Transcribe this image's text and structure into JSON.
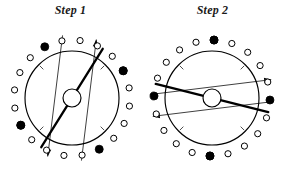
{
  "figure": {
    "caption_present": false,
    "background_color": "#ffffff",
    "stroke_color": "#000000",
    "panel_count": 2
  },
  "panels": [
    {
      "id": "step-1",
      "title": "Step 1",
      "center": {
        "x": 72,
        "y": 78
      },
      "outer_circle_radius": 47,
      "hub_circle_radius": 9,
      "marker_ring_radius": 58,
      "marker_radius": 3.1,
      "marker_count": 20,
      "filled_marker_indices": [
        2,
        7,
        12,
        17
      ],
      "ring_start_angle_deg": -64,
      "chord": {
        "label": "thick-chord",
        "angle_deg": -58,
        "stroke_width": 2.3,
        "from_marker_index": 12,
        "to_marker_index": 2
      },
      "thin_lines": [
        {
          "label": "thin-line-left",
          "angle_deg": -83,
          "offset": -17,
          "arrow_at": "start"
        },
        {
          "label": "thin-line-right",
          "angle_deg": -83,
          "offset": 17,
          "arrow_at": "end"
        }
      ],
      "tick_marks_deg": [
        135,
        45,
        225,
        315
      ]
    },
    {
      "id": "step-2",
      "title": "Step 2",
      "center": {
        "x": 70,
        "y": 78
      },
      "outer_circle_radius": 47,
      "hub_circle_radius": 9,
      "marker_ring_radius": 58,
      "marker_radius": 3.1,
      "marker_count": 20,
      "filled_marker_indices": [
        2,
        7,
        12,
        17
      ],
      "ring_start_angle_deg": -124,
      "chord": {
        "label": "thick-chord",
        "angle_deg": 14,
        "stroke_width": 2.3,
        "from_marker_index": 12,
        "to_marker_index": 2
      },
      "thin_lines": [
        {
          "label": "thin-line-upper",
          "angle_deg": -7,
          "offset": -11,
          "arrow_at": "end"
        },
        {
          "label": "thin-line-lower",
          "angle_deg": -7,
          "offset": 11,
          "arrow_at": "start"
        }
      ],
      "tick_marks_deg": [
        135,
        45,
        225,
        315
      ]
    }
  ],
  "colors": {
    "ink": "#000000",
    "title_ink": "#1a1a1a",
    "paper": "#ffffff"
  }
}
